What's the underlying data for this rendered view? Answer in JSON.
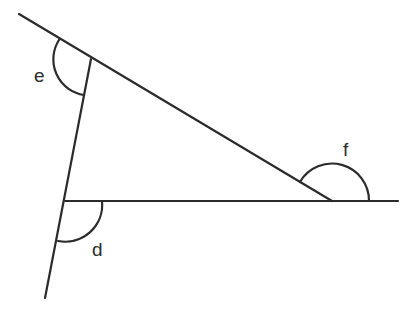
{
  "diagram": {
    "type": "geometry-triangle-exterior-angles",
    "line_color": "#2b2b2b",
    "angles": [
      {
        "id": "e",
        "label": "e",
        "position": "upper-left vertex, exterior angle"
      },
      {
        "id": "d",
        "label": "d",
        "position": "lower-left vertex, exterior angle"
      },
      {
        "id": "f",
        "label": "f",
        "position": "right vertex, exterior angle"
      }
    ]
  }
}
